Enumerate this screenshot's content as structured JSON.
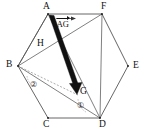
{
  "figure": {
    "type": "geometry-diagram",
    "shape": "hexagon",
    "width": 146,
    "height": 135,
    "background": "#ffffff",
    "stroke_color": "#444444",
    "bold_stroke_color": "#111111"
  },
  "vertices": [
    {
      "id": "A",
      "label": "A",
      "x": 48,
      "y": 14,
      "label_x": 43,
      "label_y": 2
    },
    {
      "id": "F",
      "label": "F",
      "x": 102,
      "y": 14,
      "label_x": 101,
      "label_y": 2
    },
    {
      "id": "E",
      "label": "E",
      "x": 128,
      "y": 66,
      "label_x": 132,
      "label_y": 62
    },
    {
      "id": "D",
      "label": "D",
      "x": 100,
      "y": 118,
      "label_x": 99,
      "label_y": 120
    },
    {
      "id": "C",
      "label": "C",
      "x": 48,
      "y": 118,
      "label_x": 43,
      "label_y": 120
    },
    {
      "id": "B",
      "label": "B",
      "x": 18,
      "y": 66,
      "label_x": 7,
      "label_y": 61
    }
  ],
  "interior_points": [
    {
      "id": "H",
      "label": "H",
      "x": 53,
      "y": 45,
      "label_x": 38,
      "label_y": 40
    },
    {
      "id": "G",
      "label": "G",
      "x": 76,
      "y": 92,
      "label_x": 79,
      "label_y": 88
    }
  ],
  "vector": {
    "from": "A",
    "to": "G",
    "scalar_label": "s",
    "vector_label": "AG",
    "full_label": "sAG",
    "notation": "arrow-overbar",
    "label_x": 56,
    "label_y": 20,
    "style": "thick-filled-arrow"
  },
  "top_edge_arrow": {
    "from": "A",
    "to": "F",
    "style": "thin-arrow",
    "x1": 56,
    "y1": 18,
    "x2": 74,
    "y2": 18
  },
  "angle_marks": [
    {
      "id": "mark-1",
      "label": "①",
      "number": 1,
      "at_vertex": "D",
      "label_x": 78,
      "label_y": 102
    },
    {
      "id": "mark-2",
      "label": "②",
      "number": 2,
      "at_vertex": "B",
      "label_x": 31,
      "label_y": 82
    }
  ],
  "segments": [
    {
      "id": "A-F",
      "from": "A",
      "to": "F",
      "style": "solid"
    },
    {
      "id": "F-E",
      "from": "F",
      "to": "E",
      "style": "solid"
    },
    {
      "id": "E-D",
      "from": "E",
      "to": "D",
      "style": "solid"
    },
    {
      "id": "D-C",
      "from": "D",
      "to": "C",
      "style": "solid"
    },
    {
      "id": "C-B",
      "from": "C",
      "to": "B",
      "style": "solid"
    },
    {
      "id": "B-A",
      "from": "B",
      "to": "A",
      "style": "solid"
    },
    {
      "id": "A-D",
      "from": "A",
      "to": "D",
      "style": "solid"
    },
    {
      "id": "B-D",
      "from": "B",
      "to": "D",
      "style": "solid"
    },
    {
      "id": "B-F",
      "from": "B",
      "to": "F",
      "style": "solid"
    },
    {
      "id": "F-D",
      "from": "F",
      "to": "D",
      "style": "solid"
    },
    {
      "id": "B-G",
      "from": "B",
      "to": "G",
      "style": "dashed"
    }
  ]
}
